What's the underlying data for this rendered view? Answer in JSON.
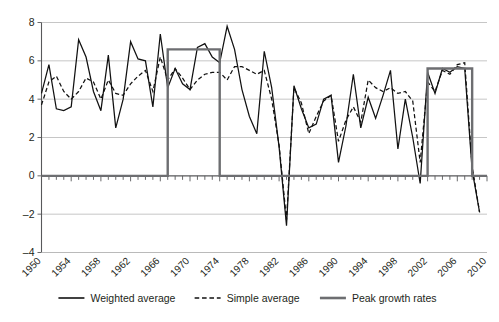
{
  "chart_data": {
    "type": "line",
    "title": "",
    "subtitle": "",
    "xlabel": "",
    "ylabel": "",
    "xlim": [
      1950,
      2010
    ],
    "ylim": [
      -4,
      8
    ],
    "yticks": [
      -4,
      -2,
      0,
      2,
      4,
      6,
      8
    ],
    "ytick_labels": [
      "-4",
      "-2",
      "0",
      "2",
      "4",
      "6",
      "8"
    ],
    "xticks": [
      1950,
      1954,
      1958,
      1962,
      1966,
      1970,
      1974,
      1978,
      1982,
      1986,
      1990,
      1994,
      1998,
      2002,
      2006,
      2010
    ],
    "xtick_labels": [
      "1950",
      "1954",
      "1958",
      "1962",
      "1966",
      "1970",
      "1974",
      "1978",
      "1982",
      "1986",
      "1990",
      "1994",
      "1998",
      "2002",
      "2006",
      "2010"
    ],
    "minor_xticks_every": 1,
    "grid": "horizontal",
    "legend_position": "bottom",
    "x": [
      1950,
      1951,
      1952,
      1953,
      1954,
      1955,
      1956,
      1957,
      1958,
      1959,
      1960,
      1961,
      1962,
      1963,
      1964,
      1965,
      1966,
      1967,
      1968,
      1969,
      1970,
      1971,
      1972,
      1973,
      1974,
      1975,
      1976,
      1977,
      1978,
      1979,
      1980,
      1981,
      1982,
      1983,
      1984,
      1985,
      1986,
      1987,
      1988,
      1989,
      1990,
      1991,
      1992,
      1993,
      1994,
      1995,
      1996,
      1997,
      1998,
      1999,
      2000,
      2001,
      2002,
      2003,
      2004,
      2005,
      2006,
      2007,
      2008,
      2009
    ],
    "series": [
      {
        "name": "Weighted average",
        "style": "solid",
        "color": "#111111",
        "values": [
          4.3,
          5.8,
          3.5,
          3.4,
          3.6,
          7.1,
          6.2,
          4.4,
          3.4,
          6.3,
          2.5,
          4.0,
          7.0,
          6.1,
          6.0,
          3.6,
          7.4,
          4.6,
          5.6,
          4.8,
          4.5,
          6.7,
          6.9,
          6.2,
          5.9,
          7.8,
          6.6,
          4.5,
          3.1,
          2.2,
          6.5,
          4.6,
          1.5,
          -2.6,
          4.7,
          3.5,
          2.5,
          2.7,
          4.0,
          4.2,
          0.7,
          2.6,
          5.3,
          2.5,
          4.1,
          3.0,
          4.2,
          5.5,
          1.4,
          4.0,
          2.0,
          -0.4,
          5.4,
          4.3,
          5.6,
          5.4,
          5.7,
          5.6,
          0.3,
          -1.9
        ]
      },
      {
        "name": "Simple average",
        "style": "dashed",
        "color": "#111111",
        "values": [
          3.7,
          4.9,
          5.2,
          4.4,
          4.0,
          4.4,
          5.1,
          4.9,
          4.0,
          5.0,
          4.3,
          4.2,
          4.8,
          5.2,
          5.5,
          4.4,
          6.2,
          5.0,
          5.6,
          5.1,
          4.5,
          5.0,
          5.3,
          5.4,
          5.4,
          5.0,
          5.7,
          5.7,
          5.5,
          5.3,
          5.5,
          4.0,
          1.6,
          -2.3,
          4.6,
          3.8,
          2.2,
          3.1,
          3.9,
          4.2,
          1.8,
          2.9,
          3.6,
          2.8,
          5.0,
          4.6,
          4.4,
          4.6,
          4.3,
          4.4,
          3.9,
          0.7,
          4.9,
          4.4,
          5.5,
          5.3,
          5.8,
          5.9,
          0.5,
          -1.9
        ]
      },
      {
        "name": "Peak growth rates",
        "style": "thick-solid",
        "color": "#6d6e71",
        "segments": [
          {
            "from": 1967,
            "to": 1974,
            "level": 6.6
          },
          {
            "from": 2002,
            "to": 2008,
            "level": 5.6
          }
        ],
        "baseline": 0.0
      }
    ],
    "legend": [
      {
        "label": "Weighted average",
        "style": "solid",
        "color": "#111111"
      },
      {
        "label": "Simple average",
        "style": "dashed",
        "color": "#111111"
      },
      {
        "label": "Peak growth rates",
        "style": "thick-solid",
        "color": "#6d6e71"
      }
    ]
  }
}
